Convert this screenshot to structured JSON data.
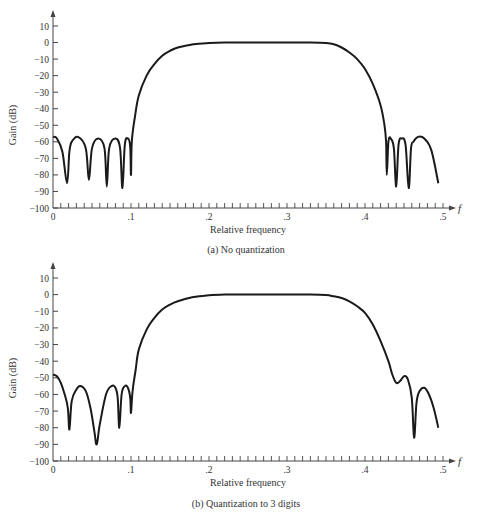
{
  "chart_data": [
    {
      "type": "line",
      "title": "",
      "caption": "(a)  No quantization",
      "xlabel": "Relative frequency",
      "ylabel": "Gain (dB)",
      "x_axis_symbol": "f",
      "xlim": [
        0,
        0.5
      ],
      "ylim": [
        -100,
        10
      ],
      "xticks": [
        0,
        0.1,
        0.2,
        0.3,
        0.4,
        0.5
      ],
      "xtick_labels": [
        "0",
        ".1",
        ".2",
        ".3",
        ".4",
        ".5"
      ],
      "yticks": [
        10,
        0,
        -10,
        -20,
        -30,
        -40,
        -50,
        -60,
        -70,
        -80,
        -90,
        -100
      ],
      "ytick_labels": [
        "10",
        "0",
        "−10",
        "−20",
        "−30",
        "−40",
        "−50",
        "−60",
        "−70",
        "−80",
        "−90",
        "−100"
      ],
      "grid": false,
      "series": [
        {
          "name": "Gain",
          "x": [
            0,
            0.005,
            0.012,
            0.018,
            0.021,
            0.024,
            0.032,
            0.042,
            0.046,
            0.05,
            0.058,
            0.066,
            0.069,
            0.072,
            0.08,
            0.086,
            0.089,
            0.092,
            0.096,
            0.099,
            0.1,
            0.101,
            0.105,
            0.11,
            0.12,
            0.13,
            0.14,
            0.15,
            0.16,
            0.18,
            0.2,
            0.22,
            0.25,
            0.3,
            0.33,
            0.35,
            0.36,
            0.37,
            0.38,
            0.39,
            0.4,
            0.41,
            0.42,
            0.425,
            0.427,
            0.428,
            0.43,
            0.433,
            0.437,
            0.44,
            0.443,
            0.447,
            0.452,
            0.456,
            0.459,
            0.462,
            0.468,
            0.476,
            0.485,
            0.494
          ],
          "values": [
            -57,
            -58,
            -66,
            -85,
            -66,
            -60,
            -57,
            -64,
            -83,
            -64,
            -58,
            -64,
            -87,
            -64,
            -58,
            -64,
            -88,
            -62,
            -58,
            -63,
            -80,
            -60,
            -45,
            -32,
            -20,
            -13,
            -8,
            -5,
            -3,
            -1,
            -0.3,
            0,
            0,
            0,
            0,
            -0.3,
            -1,
            -3,
            -6,
            -10,
            -16,
            -25,
            -38,
            -50,
            -60,
            -80,
            -60,
            -58,
            -64,
            -87,
            -62,
            -58,
            -62,
            -88,
            -64,
            -60,
            -57,
            -58,
            -65,
            -85
          ]
        }
      ]
    },
    {
      "type": "line",
      "title": "",
      "caption": "(b)  Quantization to 3 digits",
      "xlabel": "Relative frequency",
      "ylabel": "Gain (dB)",
      "x_axis_symbol": "f",
      "xlim": [
        0,
        0.5
      ],
      "ylim": [
        -100,
        10
      ],
      "xticks": [
        0,
        0.1,
        0.2,
        0.3,
        0.4,
        0.5
      ],
      "xtick_labels": [
        "0",
        ".1",
        ".2",
        ".3",
        ".4",
        ".5"
      ],
      "yticks": [
        10,
        0,
        -10,
        -20,
        -30,
        -40,
        -50,
        -60,
        -70,
        -80,
        -90,
        -100
      ],
      "ytick_labels": [
        "10",
        "0",
        "−10",
        "−20",
        "−30",
        "−40",
        "−50",
        "−60",
        "−70",
        "−80",
        "−90",
        "−100"
      ],
      "grid": false,
      "series": [
        {
          "name": "Gain",
          "x": [
            0,
            0.005,
            0.01,
            0.015,
            0.019,
            0.021,
            0.024,
            0.03,
            0.035,
            0.042,
            0.048,
            0.053,
            0.056,
            0.06,
            0.068,
            0.075,
            0.08,
            0.083,
            0.085,
            0.088,
            0.092,
            0.096,
            0.099,
            0.1,
            0.102,
            0.106,
            0.11,
            0.12,
            0.13,
            0.14,
            0.15,
            0.16,
            0.18,
            0.2,
            0.22,
            0.25,
            0.3,
            0.33,
            0.35,
            0.36,
            0.37,
            0.38,
            0.39,
            0.4,
            0.41,
            0.42,
            0.43,
            0.435,
            0.44,
            0.445,
            0.45,
            0.455,
            0.46,
            0.463,
            0.466,
            0.47,
            0.476,
            0.482,
            0.488,
            0.494
          ],
          "values": [
            -48,
            -49,
            -53,
            -60,
            -68,
            -81,
            -64,
            -57,
            -55,
            -58,
            -68,
            -82,
            -90,
            -78,
            -60,
            -55,
            -56,
            -62,
            -80,
            -60,
            -55,
            -56,
            -62,
            -71,
            -58,
            -45,
            -33,
            -21,
            -14,
            -9,
            -6,
            -4,
            -1.5,
            -0.4,
            0,
            0,
            0,
            0,
            -0.3,
            -1,
            -2,
            -4,
            -7,
            -11,
            -18,
            -28,
            -40,
            -48,
            -53,
            -52,
            -49,
            -51,
            -62,
            -86,
            -65,
            -58,
            -56,
            -60,
            -68,
            -80
          ]
        }
      ]
    }
  ],
  "panels": [
    {
      "caption": "(a)  No quantization",
      "xlabel": "Relative frequency",
      "ylabel": "Gain (dB)",
      "x_symbol": "f"
    },
    {
      "caption": "(b)  Quantization to 3 digits",
      "xlabel": "Relative frequency",
      "ylabel": "Gain (dB)",
      "x_symbol": "f"
    }
  ],
  "style": {
    "line_color": "#1a1a1a",
    "axis_color": "#444444",
    "text_color": "#333333"
  }
}
